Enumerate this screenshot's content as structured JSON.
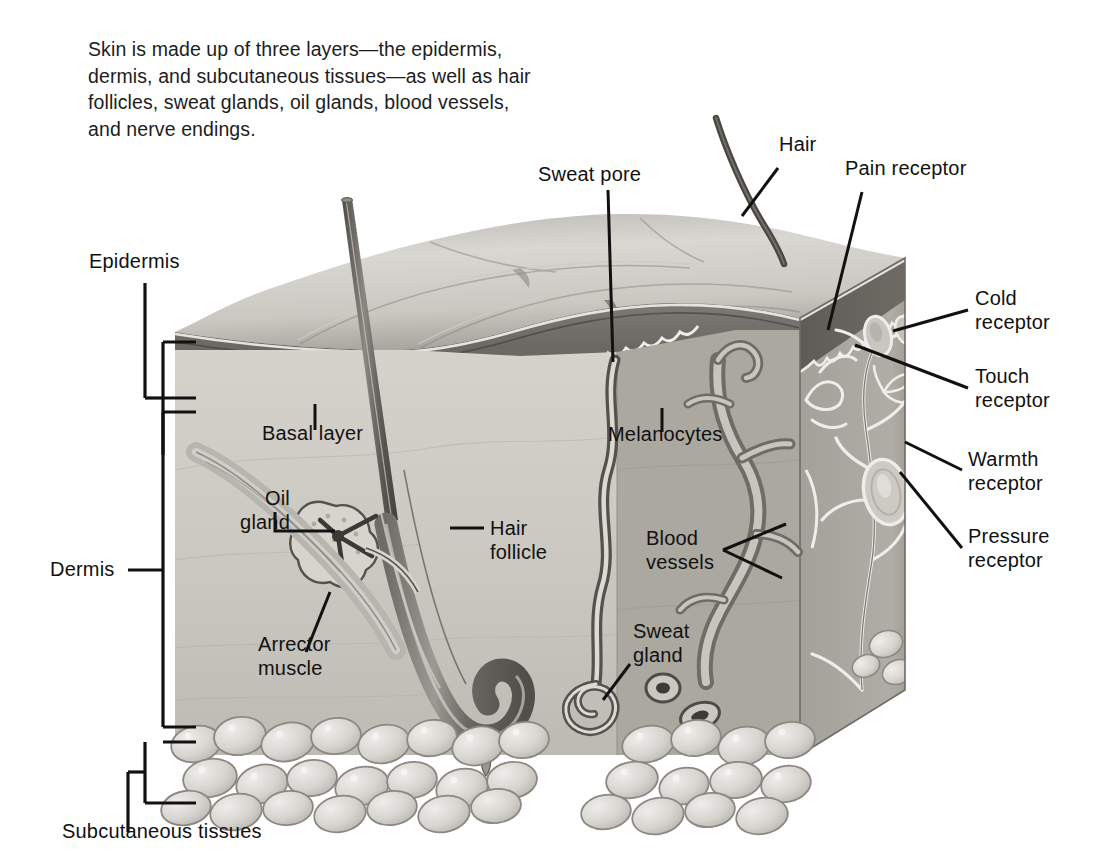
{
  "figure": {
    "caption_lines": [
      "Skin is made up of three layers—the epidermis,",
      "dermis, and subcutaneous tissues—as well as hair",
      "follicles, sweat glands, oil glands, blood vessels,",
      "and nerve endings."
    ]
  },
  "layer_brackets": [
    {
      "id": "epidermis",
      "label": "Epidermis"
    },
    {
      "id": "dermis",
      "label": "Dermis"
    },
    {
      "id": "subcutaneous",
      "label": "Subcutaneous tissues"
    }
  ],
  "callouts": {
    "hair": "Hair",
    "sweat_pore": "Sweat pore",
    "pain_receptor": "Pain receptor",
    "cold_receptor": "Cold\nreceptor",
    "touch_receptor": "Touch\nreceptor",
    "warmth_receptor": "Warmth\nreceptor",
    "pressure_receptor": "Pressure\nreceptor",
    "basal_layer": "Basal layer",
    "melanocytes": "Melanocytes",
    "oil_gland": "Oil\ngland",
    "hair_follicle": "Hair\nfollicle",
    "blood_vessels": "Blood\nvessels",
    "arrector_muscle": "Arrector\nmuscle",
    "sweat_gland": "Sweat\ngland"
  },
  "colors": {
    "background": "#ffffff",
    "ink": "#111111",
    "surface_light": "#d6d4cf",
    "surface_mid": "#b6b3ad",
    "surface_shadow": "#8e8b86",
    "epidermis_dark": "#6e6a66",
    "epidermis_edge": "#5a5650",
    "dermis_light": "#cfccc5",
    "dermis_right": "#a7a49d",
    "fat_fill": "#d9d7d2",
    "fat_edge": "#8b8882",
    "hair_shaft": "#6b6762"
  }
}
